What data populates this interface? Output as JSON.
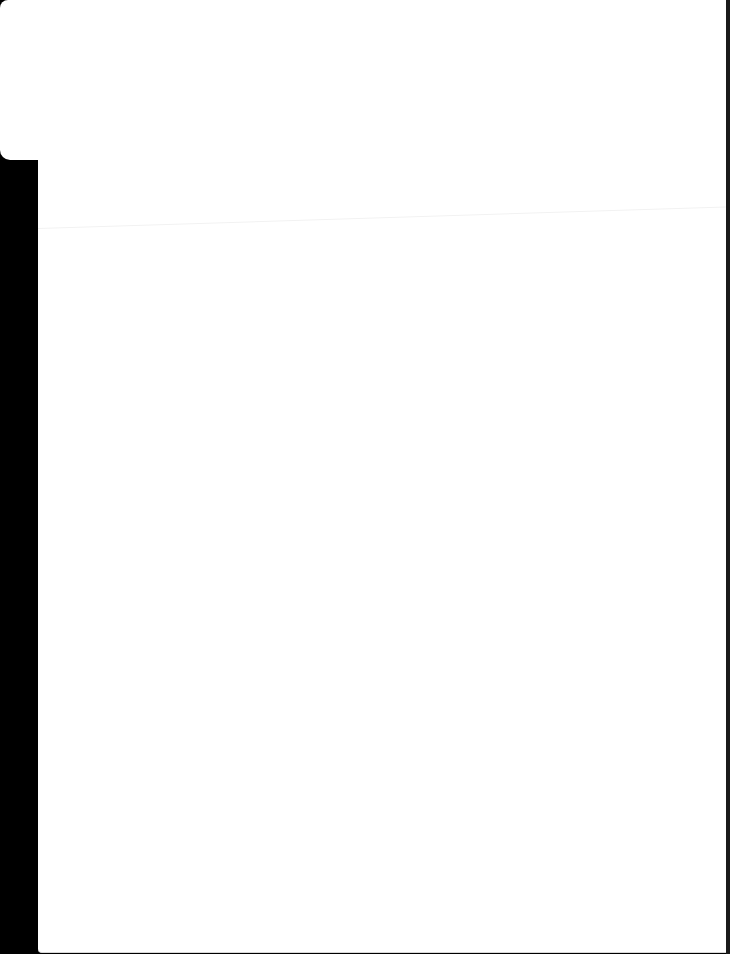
{
  "screen": {
    "description": "blank white page surface with dark left edge",
    "colors": {
      "background": "#000000",
      "surface": "#ffffff",
      "divider": "#f2f2f2"
    }
  }
}
